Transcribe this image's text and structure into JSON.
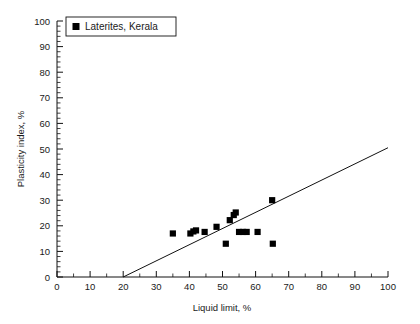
{
  "figure": {
    "background_color": "#ffffff",
    "foreground_color": "#111111"
  },
  "legend": {
    "position": "top-left-inside",
    "marker_icon": "filled-square-marker",
    "entries": [
      {
        "label": "Laterites, Kerala",
        "marker": "filled-square",
        "color": "#000000"
      }
    ]
  },
  "axes": {
    "x": {
      "title": "Liquid limit, %",
      "min": 0,
      "max": 100,
      "major_step": 10,
      "minor_step": 5,
      "tick_labels": [
        "0",
        "10",
        "20",
        "30",
        "40",
        "50",
        "60",
        "70",
        "80",
        "90",
        "100"
      ]
    },
    "y": {
      "title": "Plasticity index, %",
      "min": 0,
      "max": 100,
      "major_step": 10,
      "minor_step": 2,
      "tick_labels": [
        "0",
        "10",
        "20",
        "30",
        "40",
        "50",
        "60",
        "70",
        "80",
        "90",
        "100"
      ]
    },
    "grid": false
  },
  "chart_data": {
    "type": "scatter",
    "title": "",
    "xlabel": "Liquid limit, %",
    "ylabel": "Plasticity index, %",
    "xlim": [
      0,
      100
    ],
    "ylim": [
      0,
      100
    ],
    "grid": false,
    "legend_position": "upper left",
    "series": [
      {
        "name": "Laterites, Kerala",
        "marker": "filled-square",
        "color": "#000000",
        "points": [
          {
            "x": 35.0,
            "y": 17.0
          },
          {
            "x": 40.3,
            "y": 17.0
          },
          {
            "x": 41.2,
            "y": 17.8
          },
          {
            "x": 42.0,
            "y": 18.2
          },
          {
            "x": 44.6,
            "y": 17.6
          },
          {
            "x": 48.2,
            "y": 19.6
          },
          {
            "x": 51.0,
            "y": 13.0
          },
          {
            "x": 52.2,
            "y": 22.2
          },
          {
            "x": 53.4,
            "y": 24.2
          },
          {
            "x": 54.0,
            "y": 25.2
          },
          {
            "x": 55.0,
            "y": 17.6
          },
          {
            "x": 56.2,
            "y": 17.6
          },
          {
            "x": 57.3,
            "y": 17.6
          },
          {
            "x": 60.6,
            "y": 17.6
          },
          {
            "x": 65.0,
            "y": 30.0
          },
          {
            "x": 65.2,
            "y": 13.0
          }
        ]
      }
    ],
    "trend_line": {
      "name": "fit-line",
      "x_start": 20.0,
      "y_start": 0.0,
      "x_end": 100.0,
      "y_end": 50.5,
      "slope": 0.631,
      "intercept": -12.6,
      "color": "#111111"
    }
  }
}
